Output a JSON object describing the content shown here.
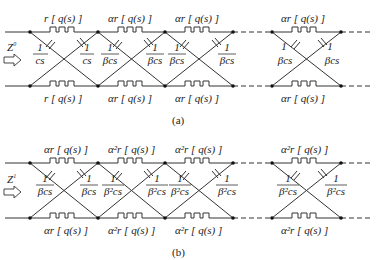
{
  "panel_a": {
    "caption": "(a)",
    "input_label": "Z",
    "input_sup": "0",
    "top_resistors": [
      "r [ q(s) ]",
      "αr [ q(s) ]",
      "αr [ q(s) ]",
      "αr [ q(s) ]"
    ],
    "bottom_resistors": [
      "r [ q(s) ]",
      "αr [ q(s) ]",
      "αr [ q(s) ]",
      "αr [ q(s) ]"
    ],
    "capacitors": [
      {
        "num": "1",
        "den": "cs"
      },
      {
        "num": "1",
        "den": "cs"
      },
      {
        "num": "1",
        "den": "βcs"
      },
      {
        "num": "1",
        "den": "βcs"
      },
      {
        "num": "1",
        "den": "βcs"
      },
      {
        "num": "1",
        "den": "βcs"
      },
      {
        "num": "1",
        "den": "βcs"
      },
      {
        "num": "1",
        "den": "βcs"
      }
    ]
  },
  "panel_b": {
    "caption": "(b)",
    "input_label": "Z",
    "input_sup": "1",
    "top_resistors": [
      "αr [ q(s) ]",
      "α²r [ q(s) ]",
      "α²r [ q(s) ]",
      "α²r [ q(s) ]"
    ],
    "bottom_resistors": [
      "αr [ q(s) ]",
      "α²r [ q(s) ]",
      "α²r [ q(s) ]",
      "α²r [ q(s) ]"
    ],
    "capacitors": [
      {
        "num": "1",
        "den": "βcs"
      },
      {
        "num": "1",
        "den": "βcs"
      },
      {
        "num": "1",
        "den": "β²cs"
      },
      {
        "num": "1",
        "den": "β²cs"
      },
      {
        "num": "1",
        "den": "β²cs"
      },
      {
        "num": "1",
        "den": "β²cs"
      },
      {
        "num": "1",
        "den": "β²cs"
      },
      {
        "num": "1",
        "den": "β²cs"
      }
    ]
  }
}
